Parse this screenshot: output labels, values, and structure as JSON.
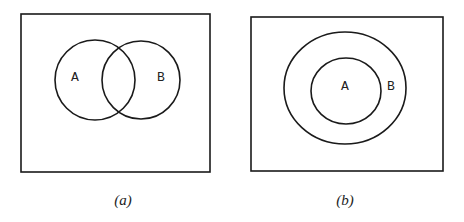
{
  "diagrams": [
    {
      "caption": "(a)",
      "description": "Two overlapping sets",
      "set_a_label": "A",
      "set_b_label": "B"
    },
    {
      "caption": "(b)",
      "description": "Set A is a subset of set B",
      "set_a_label": "A",
      "set_b_label": "B"
    }
  ],
  "colors": {
    "stroke": "#1a1a1a",
    "background": "#ffffff"
  }
}
